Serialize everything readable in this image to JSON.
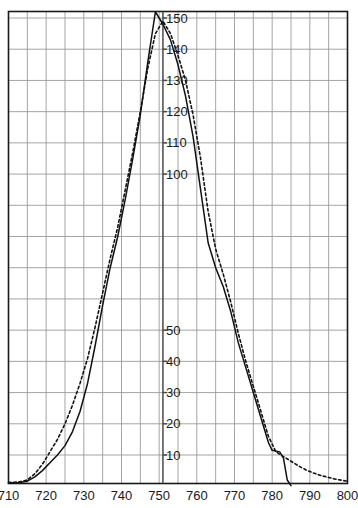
{
  "chart_data": {
    "type": "line",
    "title": "",
    "subtitle": "",
    "xlabel": "",
    "ylabel": "",
    "xlim": [
      710,
      800
    ],
    "ylim": [
      0,
      155
    ],
    "grid": true,
    "legend": "none",
    "x_ticks": [
      710,
      720,
      730,
      740,
      750,
      760,
      770,
      780,
      790,
      800
    ],
    "x_tick_labels": [
      "710",
      "720",
      "730",
      "740",
      "750",
      "760",
      "770",
      "780",
      "790",
      "800"
    ],
    "x_minor_gridlines": [
      715,
      725,
      735,
      745,
      755,
      765,
      775,
      785,
      795
    ],
    "y_ticks": [
      10,
      20,
      30,
      40,
      50,
      60,
      70,
      80,
      90,
      100,
      110,
      120,
      130,
      140,
      150
    ],
    "y_tick_labels": [
      "10",
      "20",
      "30",
      "40",
      "50",
      "",
      "",
      "",
      "",
      "100",
      "110",
      "120",
      "130",
      "140",
      "150"
    ],
    "y_axis_position_x": 751,
    "series": [
      {
        "name": "solid",
        "style": "solid",
        "color": "#111111",
        "points": [
          [
            710,
            1.0
          ],
          [
            713,
            1.2
          ],
          [
            715,
            1.6
          ],
          [
            717,
            3.0
          ],
          [
            719,
            5.0
          ],
          [
            721,
            7.5
          ],
          [
            723,
            10.0
          ],
          [
            725,
            13.0
          ],
          [
            727,
            17.5
          ],
          [
            729,
            24.0
          ],
          [
            731,
            33.0
          ],
          [
            733,
            45.0
          ],
          [
            735,
            58.0
          ],
          [
            737,
            70.0
          ],
          [
            739,
            80.0
          ],
          [
            741,
            92.0
          ],
          [
            743,
            105.0
          ],
          [
            745,
            119.0
          ],
          [
            747,
            136.0
          ],
          [
            749,
            152.0
          ],
          [
            751,
            148.0
          ],
          [
            753,
            143.0
          ],
          [
            755,
            135.0
          ],
          [
            757,
            125.0
          ],
          [
            759,
            112.0
          ],
          [
            761,
            95.0
          ],
          [
            763,
            78.0
          ],
          [
            765,
            70.0
          ],
          [
            767,
            64.0
          ],
          [
            769,
            56.0
          ],
          [
            771,
            46.0
          ],
          [
            773,
            38.0
          ],
          [
            775,
            30.0
          ],
          [
            777,
            22.0
          ],
          [
            779,
            14.0
          ],
          [
            780,
            11.5
          ],
          [
            782,
            11.0
          ],
          [
            783,
            9.0
          ],
          [
            784,
            2.0
          ],
          [
            785,
            0.2
          ]
        ]
      },
      {
        "name": "dashed",
        "style": "dashed",
        "color": "#111111",
        "points": [
          [
            710,
            1.2
          ],
          [
            713,
            1.4
          ],
          [
            715,
            2.0
          ],
          [
            717,
            4.0
          ],
          [
            719,
            7.0
          ],
          [
            721,
            11.0
          ],
          [
            723,
            15.0
          ],
          [
            725,
            20.0
          ],
          [
            727,
            26.0
          ],
          [
            729,
            33.0
          ],
          [
            731,
            41.0
          ],
          [
            733,
            51.0
          ],
          [
            735,
            62.0
          ],
          [
            737,
            73.0
          ],
          [
            739,
            83.0
          ],
          [
            741,
            95.0
          ],
          [
            743,
            107.0
          ],
          [
            745,
            120.0
          ],
          [
            747,
            134.0
          ],
          [
            749,
            145.0
          ],
          [
            751,
            149.0
          ],
          [
            753,
            145.0
          ],
          [
            755,
            138.0
          ],
          [
            757,
            130.0
          ],
          [
            759,
            119.0
          ],
          [
            761,
            105.0
          ],
          [
            763,
            88.0
          ],
          [
            765,
            76.0
          ],
          [
            767,
            68.0
          ],
          [
            769,
            59.0
          ],
          [
            771,
            49.0
          ],
          [
            773,
            40.0
          ],
          [
            775,
            32.0
          ],
          [
            777,
            24.0
          ],
          [
            779,
            16.0
          ],
          [
            781,
            11.0
          ],
          [
            783,
            9.5
          ],
          [
            785,
            8.0
          ],
          [
            787,
            6.5
          ],
          [
            789,
            5.2
          ],
          [
            791,
            4.2
          ],
          [
            793,
            3.4
          ],
          [
            795,
            2.8
          ],
          [
            797,
            2.2
          ],
          [
            799,
            1.8
          ],
          [
            800,
            1.6
          ]
        ]
      }
    ]
  }
}
